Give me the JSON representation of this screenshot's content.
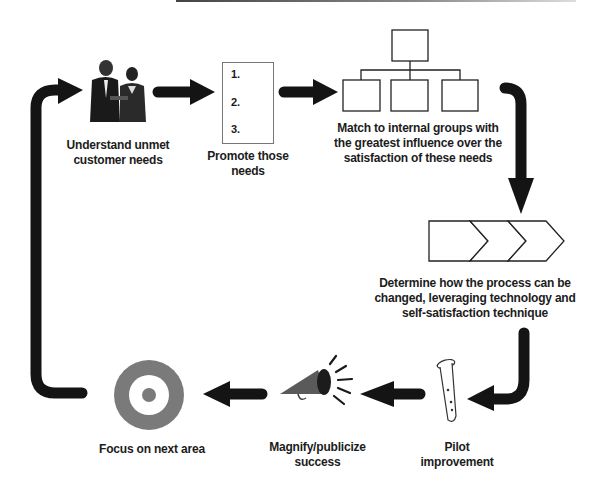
{
  "diagram": {
    "steps": [
      {
        "id": "understand",
        "label": "Understand unmet customer needs",
        "lines": [
          "Understand unmet",
          "customer needs"
        ],
        "icon": "business-people-icon"
      },
      {
        "id": "promote",
        "label": "Promote those needs",
        "lines": [
          "Promote those",
          "needs"
        ],
        "icon": "numbered-list-icon",
        "list_items": [
          "1.",
          "2.",
          "3."
        ]
      },
      {
        "id": "match",
        "label": "Match to internal groups with the greatest influence over the satisfaction of these needs",
        "lines": [
          "Match to internal groups with",
          "the greatest influence over the",
          "satisfaction of these needs"
        ],
        "icon": "org-chart-icon"
      },
      {
        "id": "determine",
        "label": "Determine how the process can be changed, leveraging technology and self-satisfaction technique",
        "lines": [
          "Determine how the process can be",
          "changed, leveraging technology and",
          "self-satisfaction technique"
        ],
        "icon": "process-chevrons-icon"
      },
      {
        "id": "pilot",
        "label": "Pilot improvement",
        "lines": [
          "Pilot",
          "improvement"
        ],
        "icon": "test-tube-icon"
      },
      {
        "id": "magnify",
        "label": "Magnify/publicize success",
        "lines": [
          "Magnify/publicize",
          "success"
        ],
        "icon": "megaphone-icon"
      },
      {
        "id": "focus",
        "label": "Focus on next area",
        "lines": [
          "Focus on next area"
        ],
        "icon": "target-icon"
      }
    ],
    "flow": "cycle",
    "colors": {
      "arrow": "#141414",
      "target": "#7a7a7a",
      "megaphone": "#5a5a5a",
      "box_border": "#222222"
    }
  }
}
